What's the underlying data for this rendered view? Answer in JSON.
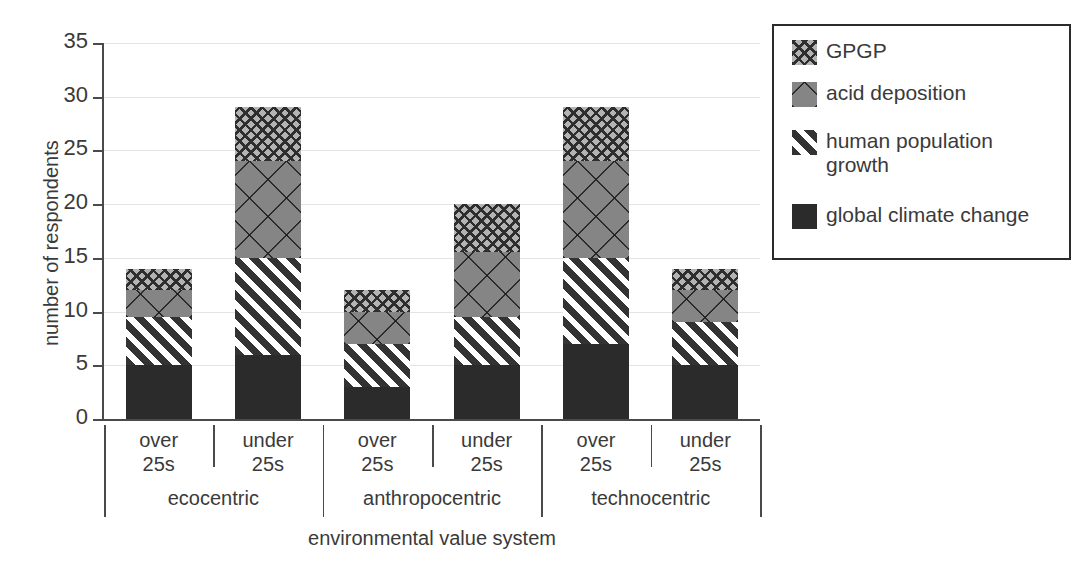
{
  "chart_data": {
    "type": "bar",
    "subtype": "stacked-bar",
    "title": "",
    "xlabel": "environmental value system",
    "ylabel": "number of respondents",
    "ylim": [
      0,
      35
    ],
    "yticks": [
      0,
      5,
      10,
      15,
      20,
      25,
      30,
      35
    ],
    "ytick_labels": [
      "0",
      "5",
      "10",
      "15",
      "20",
      "25",
      "30",
      "35"
    ],
    "grid": true,
    "grid_axis": "y",
    "legend_position": "right",
    "groups": [
      {
        "label": "ecocentric",
        "categories": [
          "over\n25s",
          "under\n25s"
        ]
      },
      {
        "label": "anthropocentric",
        "categories": [
          "over\n25s",
          "under\n25s"
        ]
      },
      {
        "label": "technocentric",
        "categories": [
          "over\n25s",
          "under\n25s"
        ]
      }
    ],
    "categories": [
      "ecocentric over 25s",
      "ecocentric under 25s",
      "anthropocentric over 25s",
      "anthropocentric under 25s",
      "technocentric over 25s",
      "technocentric under 25s"
    ],
    "series": [
      {
        "name": "global climate change",
        "pattern": "solid-black",
        "color": "#2b2b2b",
        "values": [
          5,
          6,
          3,
          5,
          7,
          5
        ]
      },
      {
        "name": "human population growth",
        "pattern": "diagonal-stripes",
        "color": "#333333",
        "values": [
          4.5,
          9,
          4,
          4.5,
          8,
          4
        ]
      },
      {
        "name": "acid deposition",
        "pattern": "gray-large-crosshatch",
        "color": "#858585",
        "values": [
          2.5,
          9,
          3,
          6,
          9,
          3
        ]
      },
      {
        "name": "GPGP",
        "pattern": "light-fine-crosshatch",
        "color": "#b3b3b3",
        "values": [
          2,
          5,
          2,
          4.5,
          5,
          2
        ]
      }
    ],
    "totals": [
      14,
      29,
      12,
      20,
      29,
      14
    ]
  },
  "legend": {
    "items": [
      {
        "label": "GPGP",
        "swatch": "light-fine-crosshatch"
      },
      {
        "label": "acid deposition",
        "swatch": "gray-large-crosshatch"
      },
      {
        "label": "human population\ngrowth",
        "swatch": "diagonal-stripes"
      },
      {
        "label": "global climate change",
        "swatch": "solid-black"
      }
    ]
  },
  "axis": {
    "y_title": "number of respondents",
    "x_title": "environmental value system",
    "ytick_labels": [
      "35",
      "30",
      "25",
      "20",
      "15",
      "10",
      "5",
      "0"
    ]
  },
  "xaxis": {
    "cat_labels": [
      "over\n25s",
      "under\n25s",
      "over\n25s",
      "under\n25s",
      "over\n25s",
      "under\n25s"
    ],
    "group_labels": [
      "ecocentric",
      "anthropocentric",
      "technocentric"
    ]
  }
}
